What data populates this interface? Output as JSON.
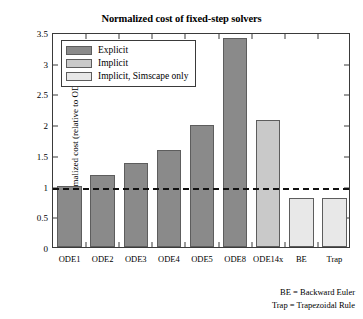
{
  "chart_data": {
    "type": "bar",
    "title": "Normalized cost of fixed-step solvers",
    "xlabel": "",
    "ylabel": "Normalized cost (relative to ODE1)",
    "categories": [
      "ODE1",
      "ODE2",
      "ODE3",
      "ODE4",
      "ODE5",
      "ODE8",
      "ODE14x",
      "BE",
      "Trap"
    ],
    "values": [
      1.0,
      1.18,
      1.36,
      1.58,
      1.99,
      3.4,
      2.06,
      0.8,
      0.8
    ],
    "groups": [
      "Explicit",
      "Explicit",
      "Explicit",
      "Explicit",
      "Explicit",
      "Explicit",
      "Implicit",
      "Implicit, Simscape only",
      "Implicit, Simscape only"
    ],
    "ylim": [
      0,
      3.5
    ],
    "yticks": [
      "0",
      "0.5",
      "1",
      "1.5",
      "2",
      "2.5",
      "3",
      "3.5"
    ],
    "ytick_values": [
      0,
      0.5,
      1,
      1.5,
      2,
      2.5,
      3,
      3.5
    ],
    "grid": false,
    "legend_position": "upper left",
    "reference_line": {
      "value": 1.0,
      "style": "dashed",
      "color": "#111111"
    },
    "series_colors": {
      "explicit": "#8a8a8a",
      "implicit": "#c9c9c9",
      "implicit_simscape": "#e8e8e8"
    },
    "annotations": [
      "BE = Backward Euler",
      "Trap = Trapezoidal Rule"
    ]
  },
  "legend": {
    "items": [
      {
        "label": "Explicit",
        "color": "#8a8a8a"
      },
      {
        "label": "Implicit",
        "color": "#c9c9c9"
      },
      {
        "label": "Implicit, Simscape only",
        "color": "#e8e8e8"
      }
    ]
  },
  "footnotes": [
    "BE = Backward Euler",
    "Trap = Trapezoidal Rule"
  ]
}
